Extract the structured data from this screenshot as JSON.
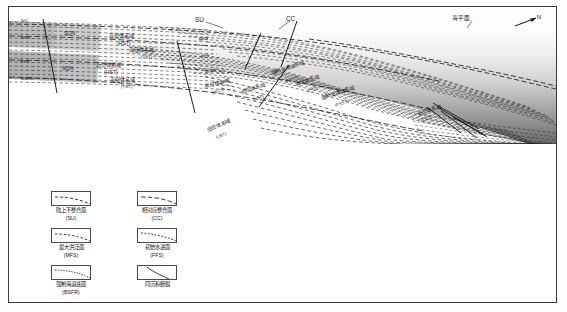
{
  "figure": {
    "top_labels": {
      "su": "SU",
      "cc": "CC",
      "sea_level": "海平面",
      "north": "N"
    },
    "section_labels": [
      {
        "id": "sqn-upper",
        "text": "SQN"
      },
      {
        "id": "sqn-lower",
        "text": "SQN"
      },
      {
        "id": "hst-upper-cn",
        "text": "高位体系域"
      },
      {
        "id": "hst-upper-ab",
        "text": "(HST)"
      },
      {
        "id": "tst-upper-cn",
        "text": "海侵体系域"
      },
      {
        "id": "tst-upper-ab",
        "text": "(TST)"
      },
      {
        "id": "hst-lower-cn",
        "text": "高位体系域"
      },
      {
        "id": "hst-lower-ab",
        "text": "(HST)"
      },
      {
        "id": "tst-lower-cn",
        "text": "海侵体系域"
      },
      {
        "id": "tst-lower-ab",
        "text": "(TST)"
      },
      {
        "id": "mfs-a",
        "text": "MFS"
      },
      {
        "id": "ffs-a",
        "text": "FFS"
      },
      {
        "id": "bsfr-a",
        "text": "BSFR"
      },
      {
        "id": "hst-mid-cn",
        "text": "高位体系域"
      },
      {
        "id": "hst-mid-ab",
        "text": "(HST)"
      },
      {
        "id": "fsst-mid-cn",
        "text": "强制海退体系域"
      },
      {
        "id": "fsst-mid-ab",
        "text": "(FSST)"
      },
      {
        "id": "lst-mid-cn",
        "text": "低位体系域"
      },
      {
        "id": "lst-mid-ab",
        "text": "(LST)"
      },
      {
        "id": "lst-low-cn",
        "text": "低位体系域"
      },
      {
        "id": "lst-low-ab",
        "text": "(LST)"
      },
      {
        "id": "fsst-right-cn",
        "text": "强制海退体系域"
      },
      {
        "id": "fsst-right-ab",
        "text": "(FSST)"
      },
      {
        "id": "lst-right-cn",
        "text": "低位体系域"
      },
      {
        "id": "lst-right-ab",
        "text": "(LST)"
      },
      {
        "id": "edge-su-top",
        "text": "SU"
      },
      {
        "id": "edge-mfs",
        "text": "MFS"
      },
      {
        "id": "edge-ffs",
        "text": "FFS"
      },
      {
        "id": "edge-bsfr",
        "text": "BSFR"
      },
      {
        "id": "tst-right-cn",
        "text": "海侵体系域"
      },
      {
        "id": "tst-right-ab",
        "text": "(TST)"
      }
    ]
  },
  "legend": {
    "items": [
      {
        "cn": "陆上不整合面",
        "abbr": "(SU)",
        "symbol": "dashed-surface-su"
      },
      {
        "cn": "相对应整合面",
        "abbr": "(CC)",
        "symbol": "dashed-surface-cc"
      },
      {
        "cn": "最大洪泛面",
        "abbr": "(MFS)",
        "symbol": "dashed-surface-mfs"
      },
      {
        "cn": "初始水进面",
        "abbr": "(FFS)",
        "symbol": "dashed-surface-ffs"
      },
      {
        "cn": "强制海退底面",
        "abbr": "(BSFR)",
        "symbol": "dashed-surface-bsfr"
      },
      {
        "cn": "同沉积断裂",
        "abbr": "",
        "symbol": "growth-fault"
      }
    ]
  },
  "colors": {
    "frame": "#3a3a3a",
    "line": "#2b2b2b",
    "water_top": "#fbfbfb",
    "water_bottom": "#6e6e6e",
    "shelf_shade": "#bdbdbd",
    "text": "#111111"
  }
}
